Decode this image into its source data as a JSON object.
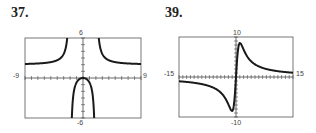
{
  "chart_data": [
    {
      "type": "line",
      "label": "37.",
      "xlim": [
        -9,
        9
      ],
      "ylim": [
        -6,
        6
      ],
      "tick_labels": {
        "xmin": "-9",
        "xmax": "9",
        "ymax": "6",
        "ymin": "-6"
      },
      "grid": false,
      "x_ticks_step": 1,
      "y_ticks_step": 1,
      "description": "Rational function with vertical asymptotes at x=-2 and x=2, horizontal asymptote y=2, local max at (0,0)",
      "series": [
        {
          "name": "f(x)",
          "formula": "2x^2/(x^2-4)"
        }
      ]
    },
    {
      "type": "line",
      "label": "39.",
      "xlim": [
        -15,
        15
      ],
      "ylim": [
        -10,
        10
      ],
      "tick_labels": {
        "xmin": "-15",
        "xmax": "15",
        "ymax": "10",
        "ymin": "-10"
      },
      "grid": false,
      "x_ticks_step": 1,
      "y_ticks_step": 1,
      "description": "Odd rational function with peak near (1,9), trough near (-1,-9), approaching y=2 to the right and y=-2 to the left",
      "series": [
        {
          "name": "f(x)",
          "formula": "odd function, peak ~(1,9), trough ~(-1,-9)"
        }
      ]
    }
  ]
}
